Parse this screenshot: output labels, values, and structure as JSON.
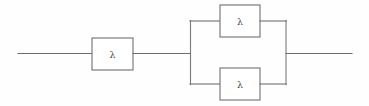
{
  "diagram": {
    "type": "reliability-block-diagram",
    "background_color": "#fefefe",
    "line_color": "#6f6f6f",
    "label_color": "#4a4a4a",
    "canvas": {
      "width": 369,
      "height": 106
    },
    "symbol": "λ",
    "blocks": [
      {
        "id": "series-block",
        "label": "λ",
        "position": "series",
        "x": 92,
        "y": 38,
        "width": 41,
        "height": 32,
        "center_x": 112.5,
        "center_y": 54
      },
      {
        "id": "parallel-block-upper",
        "label": "λ",
        "position": "parallel-upper",
        "x": 220,
        "y": 5,
        "width": 40,
        "height": 32,
        "center_x": 240,
        "center_y": 21
      },
      {
        "id": "parallel-block-lower",
        "label": "λ",
        "position": "parallel-lower",
        "x": 220,
        "y": 68,
        "width": 40,
        "height": 32,
        "center_x": 240,
        "center_y": 84
      }
    ],
    "wires": {
      "input_lead": {
        "x1": 18,
        "y1": 53.5,
        "x2": 92,
        "y2": 53.5
      },
      "series_to_split": {
        "x1": 133,
        "y1": 53.5,
        "x2": 190,
        "y2": 53.5
      },
      "split_bus": {
        "x1": 190,
        "y1": 21,
        "x2": 190,
        "y2": 84
      },
      "branch_upper_left": {
        "x1": 190,
        "y1": 21,
        "x2": 220,
        "y2": 21
      },
      "branch_lower_left": {
        "x1": 190,
        "y1": 84,
        "x2": 220,
        "y2": 84
      },
      "branch_upper_right": {
        "x1": 260,
        "y1": 21,
        "x2": 286,
        "y2": 21
      },
      "branch_lower_right": {
        "x1": 260,
        "y1": 84,
        "x2": 286,
        "y2": 84
      },
      "join_bus": {
        "x1": 286,
        "y1": 21,
        "x2": 286,
        "y2": 84
      },
      "output_lead": {
        "x1": 286,
        "y1": 53.5,
        "x2": 352,
        "y2": 53.5
      }
    }
  }
}
